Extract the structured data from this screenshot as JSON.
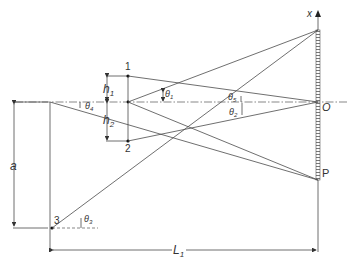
{
  "diagram": {
    "type": "optics-geometry",
    "axis_label": "x",
    "origin_label": "O",
    "point_P_label": "P",
    "points": [
      {
        "id": "1",
        "label": "1"
      },
      {
        "id": "2",
        "label": "2"
      },
      {
        "id": "3",
        "label": "3"
      }
    ],
    "distances": {
      "h1": {
        "base": "h",
        "sub": "1"
      },
      "h2": {
        "base": "h",
        "sub": "2"
      },
      "a": "a",
      "L1": {
        "base": "L",
        "sub": "1"
      }
    },
    "angles": {
      "theta1": {
        "base": "θ",
        "sub": "1"
      },
      "theta2": {
        "base": "θ",
        "sub": "2"
      },
      "theta3": {
        "base": "θ",
        "sub": "3"
      },
      "theta4": {
        "base": "θ",
        "sub": "4"
      },
      "theta5": {
        "base": "θ",
        "sub": "5"
      }
    },
    "colors": {
      "line": "#4a4a4a",
      "background": "#ffffff"
    }
  }
}
